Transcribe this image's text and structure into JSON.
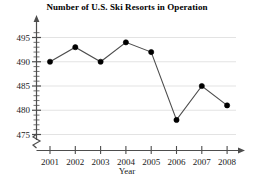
{
  "chart_data": {
    "type": "line",
    "title": "Number of U.S. Ski Resorts in Operation",
    "xlabel": "Year",
    "ylabel": "",
    "categories": [
      "2001",
      "2002",
      "2003",
      "2004",
      "2005",
      "2006",
      "2007",
      "2008"
    ],
    "values": [
      490,
      493,
      490,
      494,
      492,
      478,
      485,
      481
    ],
    "series": [
      {
        "name": "U.S. Ski Resorts in Operation",
        "values": [
          490,
          493,
          490,
          494,
          492,
          478,
          485,
          481
        ]
      }
    ],
    "x": [
      2001,
      2002,
      2003,
      2004,
      2005,
      2006,
      2007,
      2008
    ],
    "yticks": [
      475,
      480,
      485,
      490,
      495
    ],
    "ytick_labels": [
      "475",
      "480",
      "485",
      "490",
      "495"
    ],
    "xtick_labels": [
      "2001",
      "2002",
      "2003",
      "2004",
      "2005",
      "2006",
      "2007",
      "2008"
    ],
    "ylim": [
      473,
      497
    ],
    "grid": "horizontal",
    "legend": "none",
    "axis_break": "y-axis break below 475",
    "marker": "filled-circle",
    "line_color": "#4d4d4d",
    "marker_color": "#000000",
    "grid_color": "#e3e3e3",
    "axis_color": "#4d4d4d",
    "minor_ticks": "every 1 unit on y-axis"
  },
  "axes": {
    "x_title": "Year"
  }
}
